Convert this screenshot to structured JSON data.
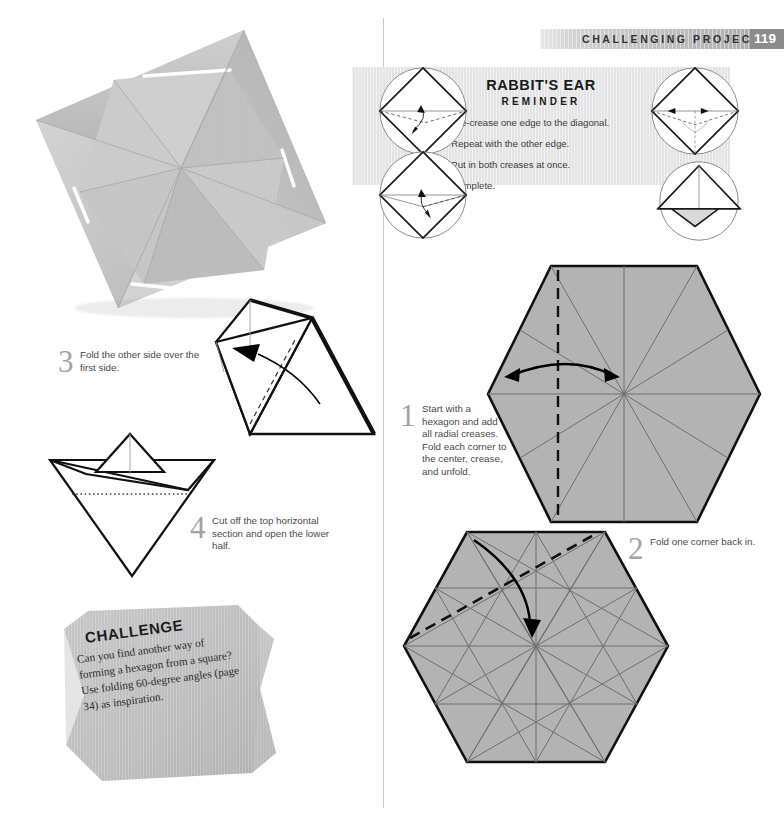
{
  "page": {
    "running_head": "CHALLENGING PROJECTS",
    "page_number": "119",
    "divider_color": "#c9c9c9",
    "header_accent": "#8c8c8c"
  },
  "reminder": {
    "title": "RABBIT'S EAR",
    "subtitle": "REMINDER",
    "panel_color": "#e3e3e3",
    "steps": [
      {
        "num": "1.",
        "text": "Pre-crease one edge to the diagonal."
      },
      {
        "num": "2.",
        "text": "Repeat with the other edge."
      },
      {
        "num": "3.",
        "text": "Put in both creases at once."
      },
      {
        "num": "4.",
        "text": "Complete."
      }
    ],
    "diagram_labels": [
      "rabbit-ear-diagram-precrease-one-edge",
      "rabbit-ear-diagram-repeat-other-edge",
      "rabbit-ear-diagram-both-creases",
      "rabbit-ear-diagram-complete"
    ]
  },
  "steps": {
    "one": {
      "num": "1",
      "text": "Start with a hexagon and add all radial creases. Fold each corner to the center, crease, and unfold."
    },
    "two": {
      "num": "2",
      "text": "Fold one corner back in."
    },
    "three": {
      "num": "3",
      "text": "Fold the other side over the first side."
    },
    "four": {
      "num": "4",
      "text": "Cut off the top horizontal section and open the lower half."
    }
  },
  "challenge": {
    "title": "CHALLENGE",
    "text": "Can you find another way of forming a hexagon from a square? Use folding 60-degree angles (page 34) as inspiration.",
    "box_color": "#bfbfbf"
  },
  "photo": {
    "caption": "folded-hexagon-paper-photograph",
    "paper_color": "#c8c8c8"
  },
  "diagrams": {
    "hexagon_top": {
      "name": "hexagon-with-radial-creases",
      "fill": "#b3b3b3",
      "fold_line": "vertical-dashed-valley-fold",
      "arrow": "double-headed-fold-and-unfold-arrow"
    },
    "hexagon_bottom": {
      "name": "hexagon-with-full-crease-pattern",
      "fill": "#b3b3b3",
      "fold_line": "diagonal-dashed-valley-fold",
      "arrow": "fold-corner-to-center-arrow"
    },
    "step_three": {
      "name": "folded-paper-3d-step-three",
      "arrow": "fold-over-arrow-left"
    },
    "step_four": {
      "name": "boat-shape-with-cut-line",
      "cut_line": "dotted-horizontal-cut"
    }
  }
}
